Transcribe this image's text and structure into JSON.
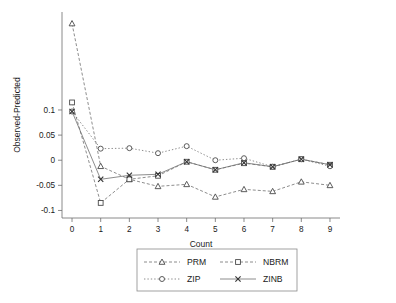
{
  "chart_data": {
    "type": "line",
    "title": "",
    "xlabel": "Count",
    "ylabel": "Observed-Predicted",
    "x": [
      0,
      1,
      2,
      3,
      4,
      5,
      6,
      7,
      8,
      9
    ],
    "xticklabels": [
      "0",
      "1",
      "2",
      "3",
      "4",
      "5",
      "6",
      "7",
      "8",
      "9"
    ],
    "yticklabels": [
      "0.1",
      "0.05",
      "0",
      "-0.05",
      "-0.1"
    ],
    "yticks": [
      0.1,
      0.05,
      0,
      -0.05,
      -0.1
    ],
    "xlim": [
      -0.35,
      9.35
    ],
    "ylim": [
      -0.115,
      0.295
    ],
    "grid": false,
    "legend_position": "below-center",
    "series": [
      {
        "name": "PRM",
        "marker": "triangle",
        "linestyle": "dashed",
        "values": [
          0.272,
          -0.012,
          -0.038,
          -0.052,
          -0.048,
          -0.073,
          -0.058,
          -0.062,
          -0.043,
          -0.05
        ]
      },
      {
        "name": "NBRM",
        "marker": "square",
        "linestyle": "dashed",
        "values": [
          0.115,
          -0.085,
          -0.038,
          -0.031,
          -0.003,
          -0.019,
          -0.006,
          -0.013,
          0.002,
          -0.009
        ]
      },
      {
        "name": "ZIP",
        "marker": "circle",
        "linestyle": "dotted",
        "values": [
          0.097,
          0.023,
          0.024,
          0.014,
          0.028,
          0.0,
          0.004,
          -0.013,
          0.002,
          -0.012
        ]
      },
      {
        "name": "ZINB",
        "marker": "x",
        "linestyle": "solid",
        "values": [
          0.097,
          -0.038,
          -0.03,
          -0.028,
          -0.003,
          -0.019,
          -0.005,
          -0.013,
          0.002,
          -0.009
        ]
      }
    ]
  },
  "legend": {
    "entries": [
      {
        "label": "PRM",
        "marker": "triangle-marker-icon"
      },
      {
        "label": "NBRM",
        "marker": "square-marker-icon"
      },
      {
        "label": "ZIP",
        "marker": "circle-marker-icon"
      },
      {
        "label": "ZINB",
        "marker": "x-marker-icon"
      }
    ]
  },
  "axes": {
    "x_title": "Count",
    "y_title": "Observed-Predicted"
  }
}
